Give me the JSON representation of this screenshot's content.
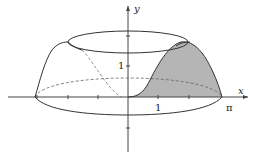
{
  "figure": {
    "type": "solid of revolution",
    "axes": {
      "x_label": "x",
      "y_label": "y"
    },
    "ticks": {
      "x_one": "1",
      "x_pi": "π",
      "y_one": "1"
    },
    "colors": {
      "stroke": "#333333",
      "shade": "#b5b5b5",
      "axis": "#444444"
    }
  }
}
